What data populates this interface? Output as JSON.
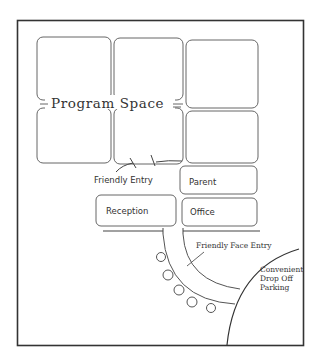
{
  "diagram": {
    "title": "Program Space",
    "labels": {
      "program_space": "Program Space",
      "friendly_entry": "Friendly Entry",
      "parent": "Parent",
      "office": "Office",
      "reception": "Reception",
      "friendly_face_entry": "Friendly Face Entry",
      "parking_line1": "Convenient",
      "parking_line2": "Drop Off",
      "parking_line3": "Parking"
    },
    "colors": {
      "stroke": "#555555",
      "border": "#333333",
      "text": "#333333",
      "background": "#ffffff"
    },
    "rooms": [
      {
        "name": "program-space-top-left"
      },
      {
        "name": "program-space-top-middle"
      },
      {
        "name": "program-space-top-right"
      },
      {
        "name": "program-space-bottom-left"
      },
      {
        "name": "program-space-bottom-middle"
      },
      {
        "name": "program-space-bottom-right"
      },
      {
        "name": "parent-room"
      },
      {
        "name": "office-room"
      },
      {
        "name": "reception-room"
      }
    ],
    "plant_count": 5
  }
}
